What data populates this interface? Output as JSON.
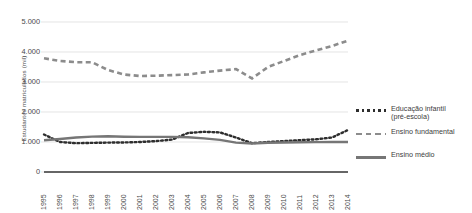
{
  "chart_data": {
    "type": "line",
    "title": "",
    "xlabel": "",
    "ylabel": "Estudantes matriculados (mil)",
    "ylim": [
      0,
      5000
    ],
    "yticks": [
      0,
      1000,
      2000,
      3000,
      4000,
      5000
    ],
    "ytick_labels": [
      "0",
      "1.000",
      "2.000",
      "3.000",
      "4.000",
      "5.000"
    ],
    "grid": true,
    "legend_position": "right",
    "categories": [
      "1995",
      "1996",
      "1997",
      "1998",
      "1999",
      "2000",
      "2001",
      "2002",
      "2003",
      "2004",
      "2005",
      "2006",
      "2007",
      "2008",
      "2009",
      "2010",
      "2011",
      "2012",
      "2013",
      "2014"
    ],
    "series": [
      {
        "name": "Educação infantil (pré-escola)",
        "style": "dotted",
        "color": "#2e2e2e",
        "values": [
          1250,
          1000,
          960,
          970,
          980,
          985,
          1000,
          1030,
          1080,
          1300,
          1340,
          1320,
          1150,
          960,
          1000,
          1030,
          1060,
          1090,
          1150,
          1400
        ]
      },
      {
        "name": "Ensino fundamental",
        "style": "dashed",
        "color": "#8c8c8c",
        "values": [
          3790,
          3700,
          3660,
          3660,
          3400,
          3250,
          3200,
          3210,
          3230,
          3250,
          3320,
          3380,
          3430,
          3120,
          3500,
          3700,
          3900,
          4050,
          4200,
          4380
        ]
      },
      {
        "name": "Ensino médio",
        "style": "solid",
        "color": "#767676",
        "values": [
          1060,
          1100,
          1150,
          1180,
          1190,
          1175,
          1170,
          1170,
          1170,
          1160,
          1120,
          1070,
          980,
          950,
          975,
          985,
          990,
          995,
          1000,
          1000
        ]
      }
    ]
  },
  "legend": {
    "items": [
      {
        "label_line1": "Educação infantil",
        "label_line2": "(pré-escola)",
        "style": "dotted"
      },
      {
        "label_line1": "Ensino fundamental",
        "label_line2": "",
        "style": "dashed"
      },
      {
        "label_line1": "Ensino médio",
        "label_line2": "",
        "style": "solid"
      }
    ]
  },
  "axes": {
    "y_title": "Estudantes matriculados (mil)"
  },
  "colors": {
    "grid": "#d8d8d8",
    "axis": "#333333",
    "text": "#3a3a3a",
    "infantil": "#2e2e2e",
    "fundamental": "#8c8c8c",
    "medio": "#767676"
  }
}
